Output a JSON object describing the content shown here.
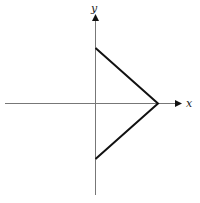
{
  "diagram": {
    "type": "coordinate-plot",
    "axes": {
      "x_label": "x",
      "y_label": "y",
      "color": "#777777"
    },
    "shape": {
      "description": "Two line segments forming a sideways V (arrowhead) pointing right, meeting on the positive x-axis",
      "color": "#111111",
      "vertices": [
        {
          "name": "top",
          "x": 0,
          "y": 1
        },
        {
          "name": "apex",
          "x": 1,
          "y": 0
        },
        {
          "name": "bottom",
          "x": 0,
          "y": -1
        }
      ]
    }
  }
}
